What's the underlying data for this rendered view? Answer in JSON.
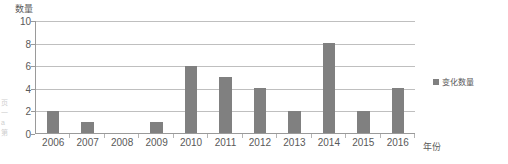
{
  "chart_data": {
    "type": "bar",
    "title": "",
    "subtitle": "",
    "xlabel": "年份",
    "ylabel": "数量",
    "categories": [
      "2006",
      "2007",
      "2008",
      "2009",
      "2010",
      "2011",
      "2012",
      "2013",
      "2014",
      "2015",
      "2016"
    ],
    "values": [
      2,
      1,
      0,
      1,
      6,
      5,
      4,
      2,
      8,
      2,
      4
    ],
    "series": [
      {
        "name": "变化数量",
        "values": [
          2,
          1,
          0,
          1,
          6,
          5,
          4,
          2,
          8,
          2,
          4
        ],
        "color": "#808080"
      }
    ],
    "ylim": [
      0,
      10
    ],
    "y_ticks": [
      "0",
      "2",
      "4",
      "6",
      "8",
      "10"
    ],
    "grid": true,
    "legend_position": "right",
    "legend": [
      "变化数量"
    ],
    "annotations": []
  },
  "axes": {
    "y_title": "数量",
    "x_title": "年份",
    "y_tick_labels": [
      "10",
      "8",
      "6",
      "4",
      "2",
      "0"
    ],
    "x_tick_labels": [
      "2006",
      "2007",
      "2008",
      "2009",
      "2010",
      "2011",
      "2012",
      "2013",
      "2014",
      "2015",
      "2016"
    ]
  },
  "legend": {
    "entries": [
      {
        "label": "变化数量",
        "color": "#808080"
      }
    ]
  },
  "bars": [
    {
      "category": "2006",
      "value": 2
    },
    {
      "category": "2007",
      "value": 1
    },
    {
      "category": "2008",
      "value": 0
    },
    {
      "category": "2009",
      "value": 1
    },
    {
      "category": "2010",
      "value": 6
    },
    {
      "category": "2011",
      "value": 5
    },
    {
      "category": "2012",
      "value": 4
    },
    {
      "category": "2013",
      "value": 2
    },
    {
      "category": "2014",
      "value": 8
    },
    {
      "category": "2015",
      "value": 2
    },
    {
      "category": "2016",
      "value": 4
    }
  ],
  "edge_bleed": {
    "lines": [
      "页",
      "一",
      "a",
      "第"
    ]
  },
  "colors": {
    "bar": "#808080",
    "gridline": "#bfbfbf",
    "axis": "#9a9a9a",
    "text": "#595959",
    "background": "#ffffff"
  }
}
